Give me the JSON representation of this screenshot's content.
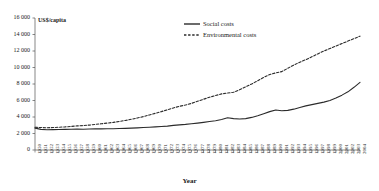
{
  "chart_data": {
    "type": "line",
    "title": "",
    "ylabel": "US$/capita",
    "xlabel": "Year",
    "ylim": [
      0,
      16000
    ],
    "ytick_values": [
      0,
      2000,
      4000,
      6000,
      8000,
      10000,
      12000,
      14000,
      16000
    ],
    "ytick_labels": [
      "0",
      "2 000",
      "4 000",
      "6 000",
      "8 000",
      "10 000",
      "12 000",
      "14 000",
      "16 000"
    ],
    "grid": false,
    "legend_position": "top-center",
    "x": [
      1950,
      1951,
      1952,
      1953,
      1954,
      1955,
      1956,
      1957,
      1958,
      1959,
      1960,
      1961,
      1962,
      1963,
      1964,
      1965,
      1966,
      1967,
      1968,
      1969,
      1970,
      1971,
      1972,
      1973,
      1974,
      1975,
      1976,
      1977,
      1978,
      1979,
      1980,
      1981,
      1982,
      1983,
      1984,
      1985,
      1986,
      1987,
      1988,
      1989,
      1990,
      1991,
      1992,
      1993,
      1994,
      1995,
      1996,
      1997,
      1998,
      1999,
      2000,
      2001,
      2002,
      2003,
      2004
    ],
    "xtick_labels": [
      "1950",
      "1951",
      "1952",
      "1953",
      "1954",
      "1955",
      "1956",
      "1957",
      "1958",
      "1959",
      "1960",
      "1961",
      "1962",
      "1963",
      "1964",
      "1965",
      "1966",
      "1967",
      "1968",
      "1969",
      "1970",
      "1971",
      "1972",
      "1973",
      "1974",
      "1975",
      "1976",
      "1977",
      "1978",
      "1979",
      "1980",
      "1981",
      "1982",
      "1983",
      "1984",
      "1985",
      "1986",
      "1987",
      "1988",
      "1989",
      "1990",
      "1991",
      "1992",
      "1993",
      "1994",
      "1995",
      "1996",
      "1997",
      "1998",
      "1999",
      "2000",
      "2001",
      "2002",
      "2003",
      "2004"
    ],
    "series": [
      {
        "name": "Social costs",
        "style": "solid",
        "color": "#2b2b2b",
        "values": [
          2650,
          2500,
          2450,
          2470,
          2480,
          2500,
          2520,
          2530,
          2520,
          2540,
          2560,
          2560,
          2570,
          2580,
          2600,
          2620,
          2650,
          2680,
          2720,
          2760,
          2800,
          2850,
          2900,
          2980,
          3050,
          3100,
          3180,
          3260,
          3350,
          3450,
          3550,
          3700,
          3900,
          3800,
          3750,
          3800,
          3950,
          4150,
          4400,
          4650,
          4850,
          4750,
          4800,
          4950,
          5150,
          5350,
          5500,
          5650,
          5800,
          6000,
          6300,
          6650,
          7050,
          7600,
          8200
        ]
      },
      {
        "name": "Environmental costs",
        "style": "dashed",
        "color": "#2b2b2b",
        "values": [
          2750,
          2720,
          2700,
          2720,
          2760,
          2800,
          2860,
          2920,
          2960,
          3020,
          3100,
          3180,
          3260,
          3350,
          3460,
          3580,
          3720,
          3880,
          4050,
          4250,
          4450,
          4650,
          4880,
          5100,
          5300,
          5450,
          5650,
          5900,
          6150,
          6400,
          6600,
          6800,
          6900,
          7000,
          7300,
          7650,
          8000,
          8400,
          8800,
          9150,
          9350,
          9500,
          9900,
          10300,
          10650,
          10950,
          11300,
          11650,
          12000,
          12300,
          12600,
          12900,
          13200,
          13500,
          13800
        ]
      }
    ]
  }
}
